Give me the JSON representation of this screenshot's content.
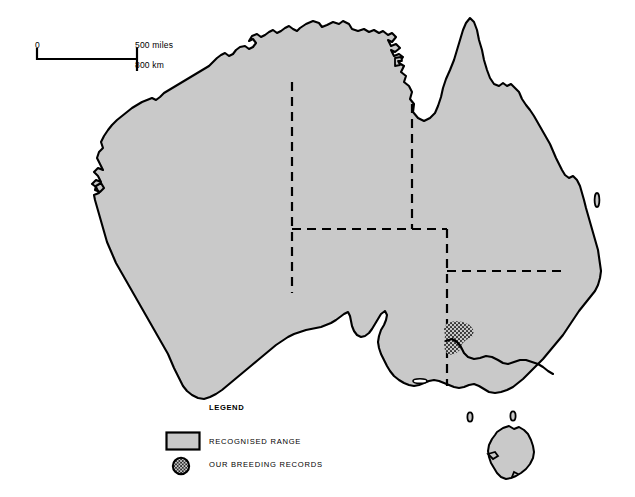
{
  "map": {
    "title": "Australia distribution map",
    "region": "Australia",
    "land_fill": "#c9c9c9",
    "outline_color": "#000000",
    "background": "#ffffff",
    "boundary_style": "dashed",
    "state_borders_count": 5
  },
  "scale_bar": {
    "zero_label": "0",
    "miles_label": "500 miles",
    "km_label": "800 km",
    "miles_value": 500,
    "km_value": 800,
    "bar_left_px": 37,
    "bar_right_px": 137
  },
  "legend": {
    "title": "LEGEND",
    "items": [
      {
        "label": "RECOGNISED RANGE",
        "swatch": "filled-rectangle",
        "swatch_fill": "#c9c9c9",
        "swatch_stroke": "#000000"
      },
      {
        "label": "OUR BREEDING RECORDS",
        "swatch": "stippled-circle",
        "swatch_fill": "stipple",
        "swatch_stroke": "#000000"
      }
    ]
  },
  "features": {
    "recognised_range_description": "Entire Australian mainland and Tasmania shaded grey",
    "breeding_record_patch": {
      "name": "breeding-record-patch",
      "location_description": "South-eastern Australia, north-western Victoria / south-eastern South Australia border",
      "pattern": "stipple",
      "center_x": 459,
      "center_y": 338
    },
    "islands": [
      "Tasmania",
      "Groote Eylandt",
      "Fraser Island",
      "King Island",
      "Flinders Island",
      "Kangaroo Island"
    ]
  }
}
